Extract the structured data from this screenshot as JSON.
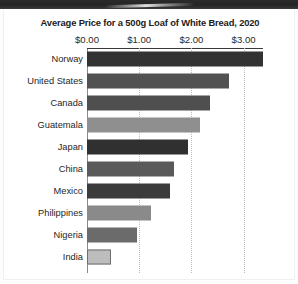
{
  "chart_data": {
    "type": "bar",
    "orientation": "horizontal",
    "title": "Average Price for a 500g Loaf of White Bread, 2020",
    "xlabel": "",
    "ylabel": "",
    "xlim": [
      0,
      3.75
    ],
    "grid": true,
    "legend": "none",
    "xticks": [
      {
        "value": 0,
        "label": "$0.00"
      },
      {
        "value": 1,
        "label": "$1.00"
      },
      {
        "value": 2,
        "label": "$2.00"
      },
      {
        "value": 3,
        "label": "$3.00"
      }
    ],
    "categories": [
      "Norway",
      "United States",
      "Canada",
      "Guatemala",
      "Japan",
      "China",
      "Mexico",
      "Philippines",
      "Nigeria",
      "India"
    ],
    "values": [
      3.37,
      2.72,
      2.36,
      2.16,
      1.93,
      1.67,
      1.59,
      1.22,
      0.96,
      0.46
    ],
    "bar_colors": [
      "#333333",
      "#525252",
      "#4f4f4f",
      "#8f8f8f",
      "#303030",
      "#5a5a5a",
      "#3b3b3b",
      "#8a8a8a",
      "#6b6b6b",
      "#bdbdbd"
    ]
  },
  "page": {
    "background_color": "#ffffff",
    "scan_band_color": "#2b2b2b",
    "axis_color": "#8a8a8a",
    "gridline_color": "#bdbdbd",
    "title_color": "#1b1b1b"
  }
}
